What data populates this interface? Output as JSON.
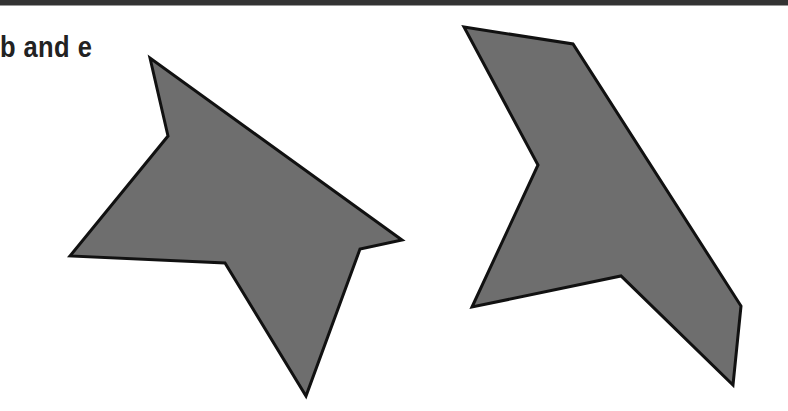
{
  "label": "b and e",
  "colors": {
    "fill": "#6e6e6e",
    "stroke": "#111111",
    "topbar": "#333333"
  },
  "shapes": [
    {
      "name": "shape-b",
      "points": "150,58 168,136 70,256 225,263 306,396 360,249 402,240"
    },
    {
      "name": "shape-e",
      "points": "464,27 573,44 741,306 733,385 621,276 472,307 538,165"
    }
  ]
}
